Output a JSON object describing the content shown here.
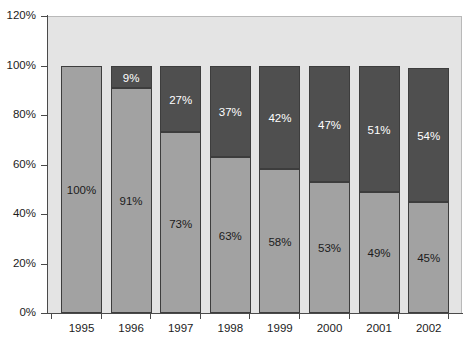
{
  "chart_data": {
    "type": "bar",
    "subtype": "stacked-100",
    "title": "",
    "subtitle": "",
    "xlabel": "",
    "ylabel": "",
    "categories": [
      "1995",
      "1996",
      "1997",
      "1998",
      "1999",
      "2000",
      "2001",
      "2002"
    ],
    "ylim": [
      0,
      120
    ],
    "yticks": [
      0,
      20,
      40,
      60,
      80,
      100,
      120
    ],
    "ytick_labels": [
      "0%",
      "20%",
      "40%",
      "60%",
      "80%",
      "100%",
      "120%"
    ],
    "grid": false,
    "legend": "none",
    "series": [
      {
        "name": "lower-segment",
        "color": "#a2a2a2",
        "values": [
          100,
          91,
          73,
          63,
          58,
          53,
          49,
          45
        ],
        "labels": [
          "100%",
          "91%",
          "73%",
          "63%",
          "58%",
          "53%",
          "49%",
          "45%"
        ]
      },
      {
        "name": "upper-segment",
        "color": "#4f4f4f",
        "values": [
          0,
          9,
          27,
          37,
          42,
          47,
          51,
          54
        ],
        "labels": [
          "",
          "9%",
          "27%",
          "37%",
          "42%",
          "47%",
          "51%",
          "54%"
        ]
      }
    ],
    "colors": {
      "plot_background": "#e4e4e4",
      "page_background": "#ffffff",
      "axis": "#4a4a4a",
      "segment_lower": "#a2a2a2",
      "segment_upper": "#4f4f4f",
      "bar_border": "#3d3d3d",
      "label_dark": "#1b1b1b",
      "label_light": "#ffffff"
    }
  }
}
